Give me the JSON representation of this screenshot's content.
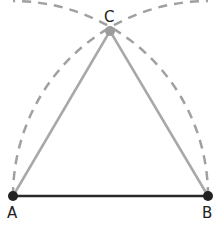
{
  "diagram": {
    "points": {
      "A": {
        "label": "A",
        "x": 13,
        "y": 196
      },
      "B": {
        "label": "B",
        "x": 208,
        "y": 196
      },
      "C": {
        "label": "C",
        "x": 110,
        "y": 31
      }
    },
    "colors": {
      "base_segment": "#2a2a2a",
      "sides": "#a8a8a8",
      "arcs": "#a0a0a0",
      "point_ab": "#222222",
      "point_c": "#9c9c9c"
    }
  }
}
